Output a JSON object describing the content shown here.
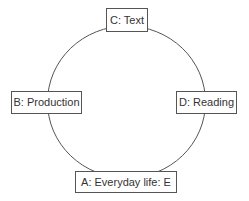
{
  "diagram": {
    "type": "cycle",
    "nodes": [
      {
        "id": "C",
        "label": "C: Text"
      },
      {
        "id": "B",
        "label": "B: Production"
      },
      {
        "id": "D",
        "label": "D: Reading"
      },
      {
        "id": "A",
        "label": "A: Everyday life: E"
      }
    ],
    "colors": {
      "line": "#555555",
      "text": "#333333",
      "background": "#ffffff"
    }
  }
}
